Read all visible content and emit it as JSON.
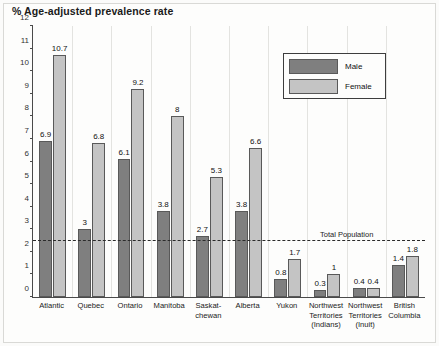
{
  "title": "% Age-adjusted prevalence rate",
  "legend": {
    "male_label": "Male",
    "female_label": "Female"
  },
  "annotation": {
    "total_population_label": "Total Population",
    "total_population_value": 2.5
  },
  "colors": {
    "male": "#7f7f7f",
    "female": "#c4c4c4",
    "axis": "#4a4a4a",
    "bar_outline": "#595959",
    "reference_line": "#2b2b2b",
    "background": "#fdfdfc",
    "text": "#1a1a1a"
  },
  "chart_data": {
    "type": "bar",
    "title": "% Age-adjusted prevalence rate",
    "xlabel": "",
    "ylabel": "% Age-adjusted prevalence rate",
    "ylim": [
      0,
      12
    ],
    "yticks": [
      0,
      1,
      2,
      3,
      4,
      5,
      6,
      7,
      8,
      9,
      10,
      11,
      12
    ],
    "ytick_labels": [
      "0",
      "1",
      "2",
      "3",
      "4",
      "5",
      "6",
      "7",
      "8",
      "9",
      "10",
      "11",
      "12"
    ],
    "grid": false,
    "legend_position": "top-right",
    "categories": [
      "Atlantic",
      "Quebec",
      "Ontario",
      "Manitoba",
      "Saskatchewan",
      "Alberta",
      "Yukon",
      "Northwest Territories (Indians)",
      "Northwest Territories (Inuit)",
      "British Columbia"
    ],
    "category_label_lines": [
      [
        "Atlantic"
      ],
      [
        "Quebec"
      ],
      [
        "Ontario"
      ],
      [
        "Manitoba"
      ],
      [
        "Saskat-",
        "chewan"
      ],
      [
        "Alberta"
      ],
      [
        "Yukon"
      ],
      [
        "Northwest",
        "Territories",
        "(Indians)"
      ],
      [
        "Northwest",
        "Territories",
        "(Inuit)"
      ],
      [
        "British",
        "Columbia"
      ]
    ],
    "series": [
      {
        "name": "Male",
        "color": "#7f7f7f",
        "values": [
          6.9,
          3,
          6.1,
          3.8,
          2.7,
          3.8,
          0.8,
          0.3,
          0.4,
          1.4
        ],
        "value_labels": [
          "6.9",
          "3",
          "6.1",
          "3.8",
          "2.7",
          "3.8",
          "0.8",
          "0.3",
          "0.4",
          "1.4"
        ]
      },
      {
        "name": "Female",
        "color": "#c4c4c4",
        "values": [
          10.7,
          6.8,
          9.2,
          8,
          5.3,
          6.6,
          1.7,
          1,
          0.4,
          1.8
        ],
        "value_labels": [
          "10.7",
          "6.8",
          "9.2",
          "8",
          "5.3",
          "6.6",
          "1.7",
          "1",
          "0.4",
          "1.8"
        ]
      }
    ],
    "annotations": [
      {
        "type": "hline",
        "label": "Total Population",
        "value": 2.5,
        "style": "dashed"
      }
    ]
  }
}
